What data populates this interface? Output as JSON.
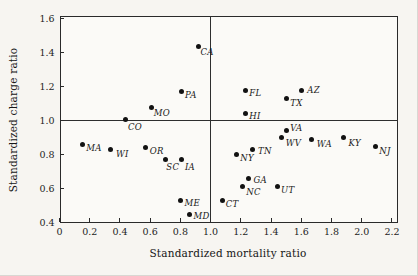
{
  "chart_data": {
    "type": "scatter",
    "title": "",
    "xlabel": "Standardized mortality ratio",
    "ylabel": "Standardized charge ratio",
    "xlim": [
      0,
      2.24
    ],
    "ylim": [
      0.4,
      1.62
    ],
    "grid": false,
    "marker_color": "#121212",
    "reference_lines": {
      "horizontal_y": 1.0,
      "vertical_x": 1.0
    },
    "x_ticks": [
      0,
      0.2,
      0.4,
      0.6,
      0.8,
      1.0,
      1.2,
      1.4,
      1.6,
      1.8,
      2.0,
      2.2
    ],
    "x_tick_labels": [
      "0",
      "0.2",
      "0.4",
      "0.6",
      "0.8",
      "1.0",
      "1.2",
      "1.4",
      "1.6",
      "1.8",
      "2.0",
      "2.2"
    ],
    "y_ticks": [
      0.4,
      0.6,
      0.8,
      1.0,
      1.2,
      1.4,
      1.6
    ],
    "y_tick_labels": [
      "0.4",
      "0.6",
      "0.8",
      "1.0",
      "1.2",
      "1.4",
      "1.6"
    ],
    "points": [
      {
        "label": "MA",
        "x": 0.15,
        "y": 0.86,
        "dx": 4,
        "dy": 0
      },
      {
        "label": "WI",
        "x": 0.34,
        "y": 0.83,
        "dx": 5,
        "dy": 0
      },
      {
        "label": "CO",
        "x": 0.44,
        "y": 1.01,
        "dx": 2,
        "dy": 4
      },
      {
        "label": "OR",
        "x": 0.57,
        "y": 0.84,
        "dx": 4,
        "dy": -1
      },
      {
        "label": "MO",
        "x": 0.61,
        "y": 1.08,
        "dx": 2,
        "dy": 2
      },
      {
        "label": "SC",
        "x": 0.7,
        "y": 0.77,
        "dx": 1,
        "dy": 3
      },
      {
        "label": "ME",
        "x": 0.8,
        "y": 0.53,
        "dx": 4,
        "dy": -1
      },
      {
        "label": "PA",
        "x": 0.81,
        "y": 1.17,
        "dx": 3,
        "dy": -1
      },
      {
        "label": "IA",
        "x": 0.81,
        "y": 0.77,
        "dx": 3,
        "dy": 3
      },
      {
        "label": "MD",
        "x": 0.86,
        "y": 0.45,
        "dx": 4,
        "dy": -2
      },
      {
        "label": "CA",
        "x": 0.92,
        "y": 1.44,
        "dx": 2,
        "dy": 2
      },
      {
        "label": "CT",
        "x": 1.08,
        "y": 0.53,
        "dx": 3,
        "dy": 0
      },
      {
        "label": "NY",
        "x": 1.17,
        "y": 0.8,
        "dx": 4,
        "dy": -1
      },
      {
        "label": "NC",
        "x": 1.21,
        "y": 0.61,
        "dx": 4,
        "dy": 1
      },
      {
        "label": "HI",
        "x": 1.23,
        "y": 1.04,
        "dx": 4,
        "dy": -2
      },
      {
        "label": "FL",
        "x": 1.23,
        "y": 1.18,
        "dx": 4,
        "dy": -1
      },
      {
        "label": "GA",
        "x": 1.25,
        "y": 0.66,
        "dx": 5,
        "dy": -2
      },
      {
        "label": "TN",
        "x": 1.28,
        "y": 0.83,
        "dx": 5,
        "dy": -3
      },
      {
        "label": "UT",
        "x": 1.44,
        "y": 0.61,
        "dx": 4,
        "dy": -1
      },
      {
        "label": "WV",
        "x": 1.47,
        "y": 0.9,
        "dx": 4,
        "dy": 1
      },
      {
        "label": "VA",
        "x": 1.5,
        "y": 0.94,
        "dx": 4,
        "dy": -7
      },
      {
        "label": "TX",
        "x": 1.5,
        "y": 1.13,
        "dx": 4,
        "dy": 0
      },
      {
        "label": "AZ",
        "x": 1.6,
        "y": 1.18,
        "dx": 6,
        "dy": -4
      },
      {
        "label": "WA",
        "x": 1.67,
        "y": 0.89,
        "dx": 5,
        "dy": 1
      },
      {
        "label": "KY",
        "x": 1.88,
        "y": 0.9,
        "dx": 5,
        "dy": 1
      },
      {
        "label": "NJ",
        "x": 2.09,
        "y": 0.85,
        "dx": 4,
        "dy": 1
      }
    ]
  }
}
